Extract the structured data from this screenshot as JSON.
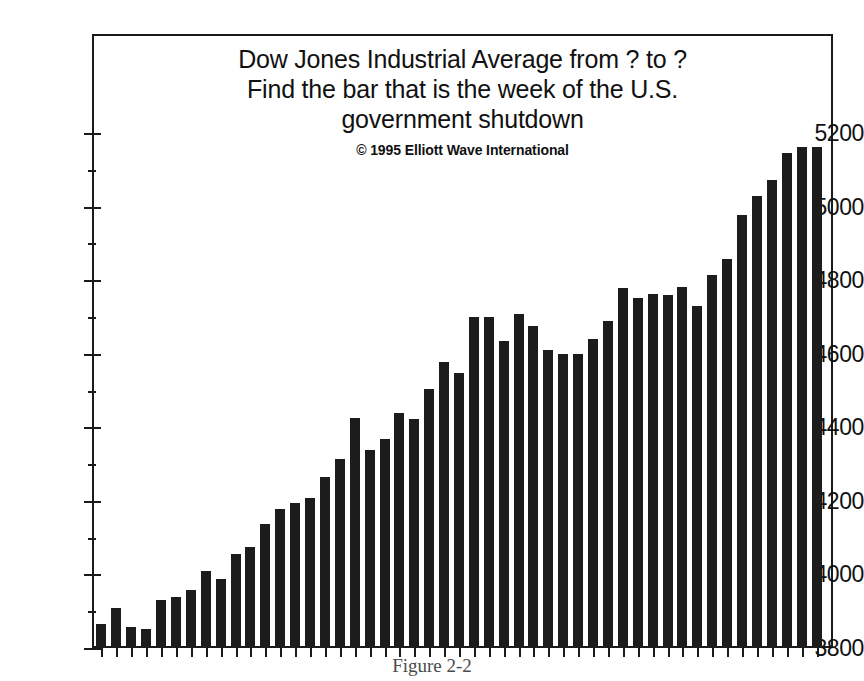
{
  "figure": {
    "title_lines": [
      "Dow Jones Industrial Average from ? to ?",
      "Find the bar that is the week of the U.S.",
      "government shutdown"
    ],
    "copyright": "© 1995 Elliott Wave International",
    "caption": "Figure 2-2"
  },
  "chart_data": {
    "type": "bar",
    "title": "Dow Jones Industrial Average from ? to ?\nFind the bar that is the week of the U.S. government shutdown",
    "subtitle": "© 1995 Elliott Wave International",
    "xlabel": "",
    "ylabel": "",
    "ylim": [
      3800,
      5200
    ],
    "ytick_labels": [
      "3800",
      "4000",
      "4200",
      "4400",
      "4600",
      "4800",
      "5000",
      "5200"
    ],
    "ytick_values": [
      3800,
      4000,
      4200,
      4400,
      4600,
      4800,
      5000,
      5200
    ],
    "grid": false,
    "legend": false,
    "bar_color": "#1c1c1c",
    "background_color": "#ffffff",
    "axis_color": "#1a1a1a",
    "x_tick_labels_visible": false,
    "n_bars": 49,
    "categories": [
      "w1",
      "w2",
      "w3",
      "w4",
      "w5",
      "w6",
      "w7",
      "w8",
      "w9",
      "w10",
      "w11",
      "w12",
      "w13",
      "w14",
      "w15",
      "w16",
      "w17",
      "w18",
      "w19",
      "w20",
      "w21",
      "w22",
      "w23",
      "w24",
      "w25",
      "w26",
      "w27",
      "w28",
      "w29",
      "w30",
      "w31",
      "w32",
      "w33",
      "w34",
      "w35",
      "w36",
      "w37",
      "w38",
      "w39",
      "w40",
      "w41",
      "w42",
      "w43",
      "w44",
      "w45",
      "w46",
      "w47",
      "w48",
      "w49"
    ],
    "values": [
      3865,
      3910,
      3857,
      3852,
      3930,
      3940,
      3958,
      4010,
      3988,
      4055,
      4075,
      4138,
      4178,
      4193,
      4208,
      4265,
      4315,
      4424,
      4337,
      4367,
      4440,
      4422,
      4505,
      4578,
      4548,
      4700,
      4700,
      4634,
      4708,
      4675,
      4610,
      4598,
      4598,
      4640,
      4690,
      4778,
      4752,
      4762,
      4760,
      4782,
      4730,
      4815,
      4858,
      4978,
      5030,
      5072,
      5145,
      5162,
      5162
    ]
  }
}
